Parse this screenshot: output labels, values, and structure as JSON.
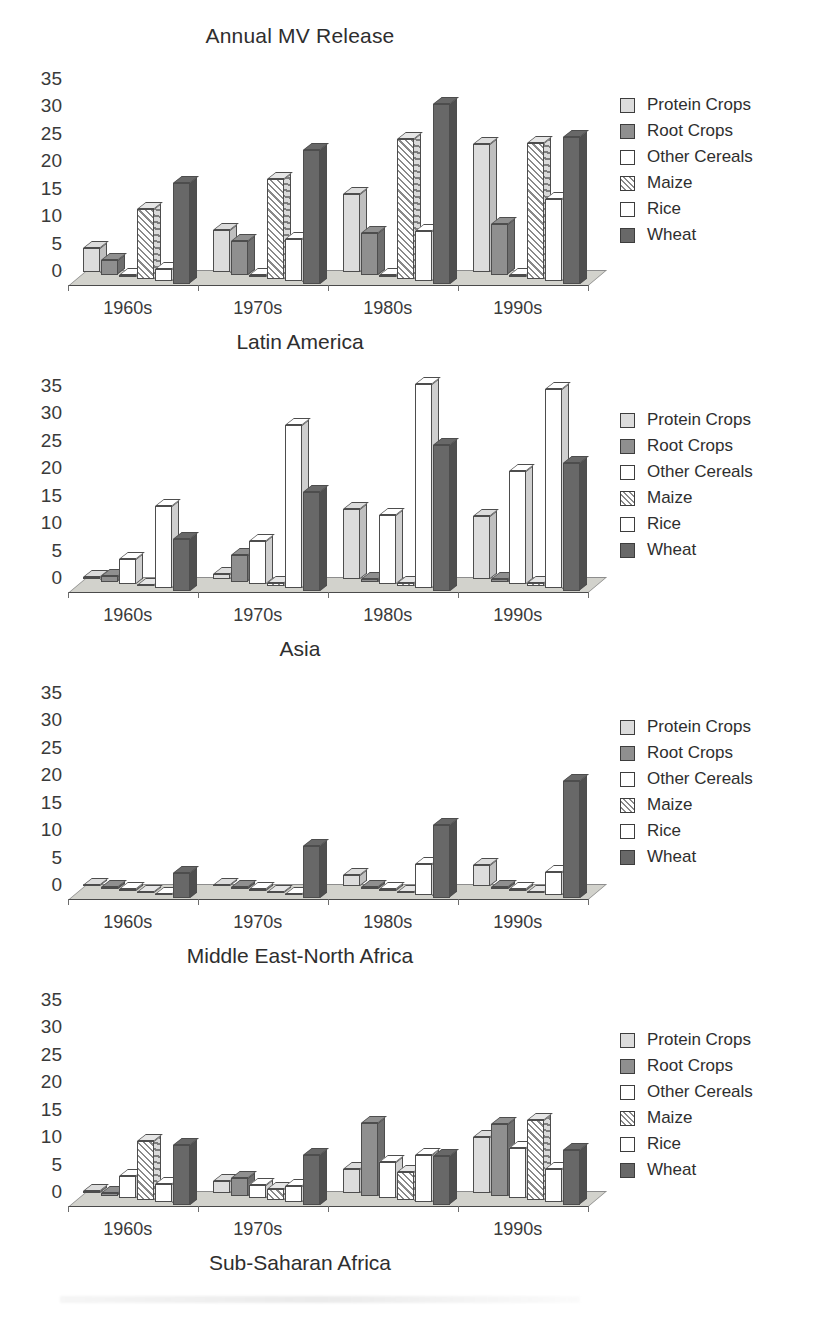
{
  "figure": {
    "title": "Annual MV Release",
    "y_ticks": [
      0,
      5,
      10,
      15,
      20,
      25,
      30,
      35
    ],
    "categories": [
      "1960s",
      "1970s",
      "1980s",
      "1990s"
    ],
    "series_names": [
      "Protein Crops",
      "Root Crops",
      "Other Cereals",
      "Maize",
      "Rice",
      "Wheat"
    ],
    "colors": {
      "protein_crops": "#dcdcdc",
      "root_crops": "#8f8f8f",
      "other_cereals": "#ffffff",
      "maize": "#ffffff",
      "rice": "#ffffff",
      "wheat": "#686868",
      "floor": "#d2d2cc",
      "outline": "#4d4d4d",
      "text": "#2e2e2e"
    }
  },
  "legend": {
    "items": [
      {
        "label": "Protein Crops",
        "swatch": "protein-crops-swatch"
      },
      {
        "label": "Root Crops",
        "swatch": "root-crops-swatch"
      },
      {
        "label": "Other Cereals",
        "swatch": "other-cereals-swatch"
      },
      {
        "label": "Maize",
        "swatch": "maize-swatch"
      },
      {
        "label": "Rice",
        "swatch": "rice-swatch"
      },
      {
        "label": "Wheat",
        "swatch": "wheat-swatch"
      }
    ]
  },
  "chart_data": [
    {
      "type": "bar",
      "title": "Annual MV Release",
      "caption": "Latin America",
      "xlabel": "",
      "ylabel": "",
      "ylim": [
        0,
        35
      ],
      "yticks": [
        0,
        5,
        10,
        15,
        20,
        25,
        30,
        35
      ],
      "grid": false,
      "legend_position": "right",
      "categories": [
        "1960s",
        "1970s",
        "1980s",
        "1990s"
      ],
      "category_labels_shown": [
        "1960s",
        "1970s",
        "1980s",
        "1990s"
      ],
      "series": [
        {
          "name": "Protein Crops",
          "values": [
            4.5,
            7.8,
            14.2,
            23.4
          ]
        },
        {
          "name": "Root Crops",
          "values": [
            2.6,
            6.2,
            7.6,
            9.2
          ]
        },
        {
          "name": "Other Cereals",
          "values": [
            0.0,
            0.0,
            0.0,
            0.0
          ]
        },
        {
          "name": "Maize",
          "values": [
            12.8,
            18.2,
            25.5,
            24.8
          ]
        },
        {
          "name": "Rice",
          "values": [
            2.2,
            7.8,
            9.2,
            15.0
          ]
        },
        {
          "name": "Wheat",
          "values": [
            18.3,
            24.4,
            32.8,
            26.8
          ]
        }
      ]
    },
    {
      "type": "bar",
      "title": "",
      "caption": "Asia",
      "xlabel": "",
      "ylabel": "",
      "ylim": [
        0,
        35
      ],
      "yticks": [
        0,
        5,
        10,
        15,
        20,
        25,
        30,
        35
      ],
      "grid": false,
      "legend_position": "right",
      "categories": [
        "1960s",
        "1970s",
        "1980s",
        "1990s"
      ],
      "category_labels_shown": [
        "1960s",
        "1970s",
        "1980s",
        "1990s"
      ],
      "series": [
        {
          "name": "Protein Crops",
          "values": [
            0.5,
            1.0,
            12.8,
            11.5
          ]
        },
        {
          "name": "Root Crops",
          "values": [
            1.0,
            4.8,
            0.5,
            0.5
          ]
        },
        {
          "name": "Other Cereals",
          "values": [
            4.5,
            7.8,
            12.6,
            20.6
          ]
        },
        {
          "name": "Maize",
          "values": [
            0.3,
            0.5,
            0.5,
            0.5
          ]
        },
        {
          "name": "Rice",
          "values": [
            15.0,
            29.8,
            37.2,
            36.4
          ]
        },
        {
          "name": "Wheat",
          "values": [
            9.5,
            18.0,
            26.6,
            23.2
          ]
        }
      ]
    },
    {
      "type": "bar",
      "title": "",
      "caption": "Middle East-North Africa",
      "xlabel": "",
      "ylabel": "",
      "ylim": [
        0,
        35
      ],
      "yticks": [
        0,
        5,
        10,
        15,
        20,
        25,
        30,
        35
      ],
      "grid": false,
      "legend_position": "right",
      "categories": [
        "1960s",
        "1970s",
        "1980s",
        "1990s"
      ],
      "category_labels_shown": [
        "1960s",
        "1970s",
        "1980s",
        "1990s"
      ],
      "series": [
        {
          "name": "Protein Crops",
          "values": [
            0.3,
            0.3,
            2.0,
            3.8
          ]
        },
        {
          "name": "Root Crops",
          "values": [
            0.3,
            0.3,
            0.3,
            0.3
          ]
        },
        {
          "name": "Other Cereals",
          "values": [
            0.3,
            0.3,
            0.3,
            0.3
          ]
        },
        {
          "name": "Maize",
          "values": [
            0.3,
            0.3,
            0.3,
            0.3
          ]
        },
        {
          "name": "Rice",
          "values": [
            0.3,
            0.3,
            5.8,
            4.2
          ]
        },
        {
          "name": "Wheat",
          "values": [
            4.6,
            9.4,
            13.2,
            21.3
          ]
        }
      ]
    },
    {
      "type": "bar",
      "title": "",
      "caption": "Sub-Saharan Africa",
      "xlabel": "",
      "ylabel": "",
      "ylim": [
        0,
        35
      ],
      "yticks": [
        0,
        5,
        10,
        15,
        20,
        25,
        30,
        35
      ],
      "grid": false,
      "legend_position": "right",
      "categories": [
        "1960s",
        "1970s",
        "1980s",
        "1990s"
      ],
      "category_labels_shown": [
        "1960s",
        "1970s",
        "",
        "1990s"
      ],
      "series": [
        {
          "name": "Protein Crops",
          "values": [
            0.4,
            2.2,
            4.4,
            10.2
          ]
        },
        {
          "name": "Root Crops",
          "values": [
            0.4,
            3.2,
            13.3,
            13.1
          ]
        },
        {
          "name": "Other Cereals",
          "values": [
            4.0,
            2.4,
            6.6,
            9.1
          ]
        },
        {
          "name": "Maize",
          "values": [
            10.7,
            2.0,
            5.2,
            14.6
          ]
        },
        {
          "name": "Rice",
          "values": [
            3.4,
            3.0,
            8.6,
            6.1
          ]
        },
        {
          "name": "Wheat",
          "values": [
            10.9,
            9.1,
            8.8,
            9.9
          ]
        }
      ]
    }
  ]
}
